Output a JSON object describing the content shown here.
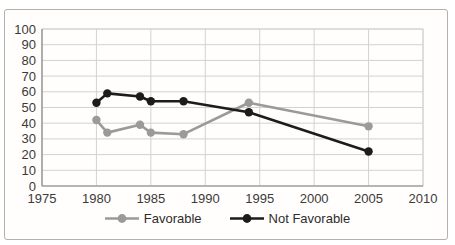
{
  "chart_data": {
    "type": "line",
    "title": "",
    "xlabel": "",
    "ylabel": "",
    "x": [
      1980,
      1981,
      1984,
      1985,
      1988,
      1994,
      2005
    ],
    "series": [
      {
        "name": "Favorable",
        "color": "#9a9a98",
        "values": [
          42,
          34,
          39,
          34,
          33,
          53,
          38
        ]
      },
      {
        "name": "Not Favorable",
        "color": "#1d1c1a",
        "values": [
          53,
          59,
          57,
          54,
          54,
          47,
          22
        ]
      }
    ],
    "xlim": [
      1975,
      2010
    ],
    "ylim": [
      0,
      100
    ],
    "xticks": [
      1975,
      1980,
      1985,
      1990,
      1995,
      2000,
      2005,
      2010
    ],
    "yticks": [
      0,
      10,
      20,
      30,
      40,
      50,
      60,
      70,
      80,
      90,
      100
    ],
    "grid": true,
    "legend_position": "bottom"
  },
  "colors": {
    "gridline": "#d4d2cf",
    "axis": "#8f8d8a",
    "tick_text": "#3c3a38",
    "frame_border": "#b4b0ab"
  }
}
